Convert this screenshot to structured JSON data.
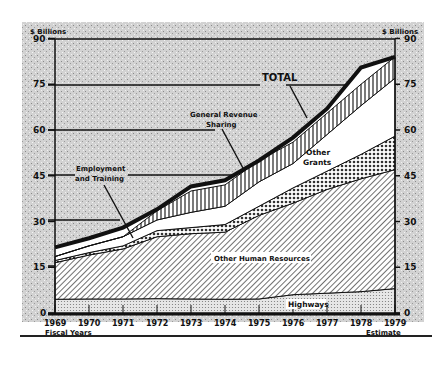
{
  "chart_data": {
    "type": "area",
    "title": "",
    "xlabel": "Fiscal Years",
    "ylabel": "$ Billions",
    "ylabel_right": "$ Billions",
    "ylim": [
      0,
      90
    ],
    "yticks": [
      0,
      15,
      30,
      45,
      60,
      75,
      90
    ],
    "categories": [
      "1969",
      "1970",
      "1971",
      "1972",
      "1973",
      "1974",
      "1975",
      "1976",
      "1977",
      "1978",
      "1979"
    ],
    "x_note": "Estimate",
    "stacked": true,
    "series": [
      {
        "name": "Highways",
        "values": [
          4.5,
          4.6,
          4.6,
          4.7,
          4.6,
          4.5,
          4.6,
          6.0,
          6.5,
          7.0,
          8.0
        ]
      },
      {
        "name": "Other Human Resources",
        "values": [
          12.0,
          14.4,
          16.4,
          20.3,
          21.4,
          22.0,
          27.4,
          30.0,
          34.0,
          37.0,
          39.0
        ]
      },
      {
        "name": "Employment and Training",
        "values": [
          0.7,
          0.8,
          1.0,
          2.0,
          2.0,
          2.5,
          3.0,
          5.0,
          6.0,
          8.0,
          11.0
        ]
      },
      {
        "name": "Other Grants",
        "values": [
          1.3,
          2.2,
          3.0,
          3.5,
          5.0,
          6.0,
          8.0,
          8.0,
          12.0,
          16.0,
          19.0
        ]
      },
      {
        "name": "General Revenue Sharing",
        "values": [
          0,
          0,
          0,
          3.0,
          7.0,
          7.0,
          7.0,
          7.0,
          7.0,
          7.0,
          7.0
        ]
      }
    ],
    "totals": [
      18.5,
      22.0,
      25.0,
      33.5,
      40.0,
      42.0,
      50.0,
      56.0,
      65.5,
      75.0,
      84.0
    ],
    "total_line": {
      "name": "TOTAL",
      "values": [
        21.5,
        24.5,
        28.0,
        34.0,
        41.5,
        43.5,
        50.0,
        57.5,
        67.0,
        80.5,
        84.0
      ]
    },
    "annotations": [
      "TOTAL",
      "General Revenue Sharing",
      "Other Grants",
      "Employment and Training",
      "Other Human Resources",
      "Highways"
    ],
    "grid": "partial horizontal reference lines",
    "legend": "inline labels"
  },
  "labels": {
    "y_unit_left": "$ Billions",
    "y_unit_right": "$ Billions",
    "fiscal_years": "Fiscal Years",
    "estimate": "Estimate",
    "total": "TOTAL",
    "grs_1": "General Revenue",
    "grs_2": "Sharing",
    "og_1": "Other",
    "og_2": "Grants",
    "et_1": "Employment",
    "et_2": "and Training",
    "ohr": "Other Human Resources",
    "hwy": "Highways"
  }
}
